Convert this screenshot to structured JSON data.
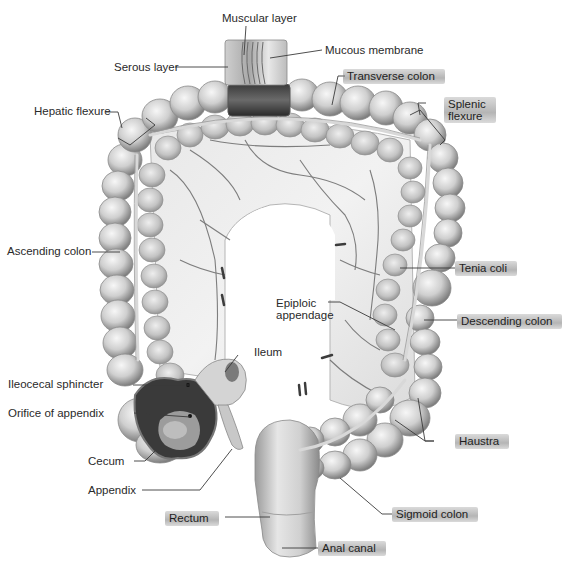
{
  "diagram": {
    "colors": {
      "background": "#ffffff",
      "tissue_light": "#e6e6e6",
      "tissue_mid": "#bdbdbd",
      "tissue_dark": "#6f6f6f",
      "lumen_dark": "#2b2b2b",
      "vessel": "#5a5a5a",
      "leader_line": "#3a3a3a",
      "highlighter": "#8c8c8c"
    },
    "labels": {
      "muscular_layer": "Muscular layer",
      "mucous_membrane": "Mucous membrane",
      "serous_layer": "Serous layer",
      "transverse_colon": "Transverse colon",
      "hepatic_flexure": "Hepatic flexure",
      "splenic_flexure_line1": "Splenic",
      "splenic_flexure_line2": "flexure",
      "ascending_colon": "Ascending colon",
      "tenia_coli": "Tenia coli",
      "epiploic_appendage_line1": "Epiploic",
      "epiploic_appendage_line2": "appendage",
      "descending_colon": "Descending colon",
      "ileum": "Ileum",
      "ileocecal_sphincter": "Ileocecal sphincter",
      "orifice_of_appendix": "Orifice of appendix",
      "haustra": "Haustra",
      "cecum": "Cecum",
      "appendix": "Appendix",
      "sigmoid_colon": "Sigmoid colon",
      "rectum": "Rectum",
      "anal_canal": "Anal canal"
    },
    "highlighted_labels": [
      "Transverse colon",
      "Splenic flexure",
      "Tenia coli",
      "Descending colon",
      "Haustra",
      "Sigmoid colon",
      "Rectum",
      "Anal canal"
    ]
  }
}
